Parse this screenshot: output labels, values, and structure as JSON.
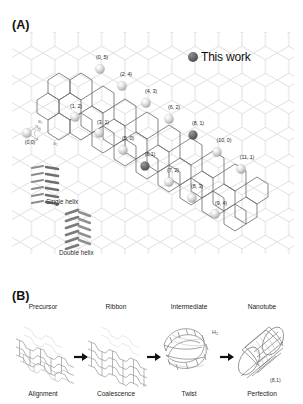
{
  "figure": {
    "panels": [
      {
        "letter": "(A)"
      },
      {
        "letter": "(B)"
      }
    ]
  },
  "panel_a": {
    "letter": "(A)",
    "legend": {
      "marker": "filled-circle",
      "label": "This work",
      "color": "#4d4d4d"
    },
    "lattice": {
      "type": "graphene-honeycomb",
      "vector_labels": [
        "a₁",
        "a₂"
      ],
      "chiral_angle_symbol": "θ"
    },
    "chirality_points": [
      {
        "label": "(0,0)",
        "n": 0,
        "m": 0,
        "highlight": false,
        "x": 15,
        "y": 101,
        "lx": 18,
        "ly": 107
      },
      {
        "label": "(0, 5)",
        "n": 0,
        "m": 5,
        "highlight": false,
        "x": 88,
        "y": 37,
        "lx": 90,
        "ly": 22
      },
      {
        "label": "(2, 4)",
        "n": 2,
        "m": 4,
        "highlight": false,
        "x": 110,
        "y": 54,
        "lx": 114,
        "ly": 39
      },
      {
        "label": "(4, 3)",
        "n": 4,
        "m": 3,
        "highlight": false,
        "x": 134,
        "y": 71,
        "lx": 139,
        "ly": 56
      },
      {
        "label": "(6, 2)",
        "n": 6,
        "m": 2,
        "highlight": false,
        "x": 157,
        "y": 87,
        "lx": 162,
        "ly": 72
      },
      {
        "label": "(8, 1)",
        "n": 8,
        "m": 1,
        "highlight": true,
        "x": 181,
        "y": 103,
        "lx": 186,
        "ly": 88
      },
      {
        "label": "(10, 0)",
        "n": 10,
        "m": 0,
        "highlight": false,
        "x": 205,
        "y": 120,
        "lx": 212,
        "ly": 105
      },
      {
        "label": "(1, 2)",
        "n": 1,
        "m": 2,
        "highlight": false,
        "x": 63,
        "y": 85,
        "lx": 64,
        "ly": 71
      },
      {
        "label": "(3, 1)",
        "n": 3,
        "m": 1,
        "highlight": false,
        "x": 87,
        "y": 101,
        "lx": 91,
        "ly": 87
      },
      {
        "label": "(5, 0)",
        "n": 5,
        "m": 0,
        "highlight": false,
        "x": 111,
        "y": 118,
        "lx": 116,
        "ly": 103
      },
      {
        "label": "(6,1)",
        "n": 6,
        "m": 1,
        "highlight": true,
        "x": 133,
        "y": 134,
        "lx": 138,
        "ly": 119
      },
      {
        "label": "(7, 2)",
        "n": 7,
        "m": 2,
        "highlight": false,
        "x": 157,
        "y": 150,
        "lx": 161,
        "ly": 135
      },
      {
        "label": "(8, 3)",
        "n": 8,
        "m": 3,
        "highlight": false,
        "x": 180,
        "y": 166,
        "lx": 185,
        "ly": 151
      },
      {
        "label": "(9, 4)",
        "n": 9,
        "m": 4,
        "highlight": false,
        "x": 203,
        "y": 182,
        "lx": 209,
        "ly": 168
      },
      {
        "label": "(11, 1)",
        "n": 11,
        "m": 1,
        "highlight": false,
        "x": 229,
        "y": 137,
        "lx": 235,
        "ly": 122
      }
    ],
    "helices": [
      {
        "label": "Single helix",
        "strands": 1
      },
      {
        "label": "Double helix",
        "strands": 2
      }
    ]
  },
  "panel_b": {
    "letter": "(B)",
    "byproduct_label": "H₂",
    "nanotube_chirality": "(8,1)",
    "stages": [
      {
        "title": "Precursor",
        "caption": "Alignment",
        "art": "stacked-molecular-precursor"
      },
      {
        "title": "Ribbon",
        "caption": "Coalescence",
        "art": "graphene-nanoribbon"
      },
      {
        "title": "Intermediate",
        "caption": "Twist",
        "art": "twisted-ribbon"
      },
      {
        "title": "Nanotube",
        "caption": "Perfection",
        "art": "carbon-nanotube"
      }
    ],
    "arrows": [
      "→",
      "→",
      "→"
    ]
  }
}
